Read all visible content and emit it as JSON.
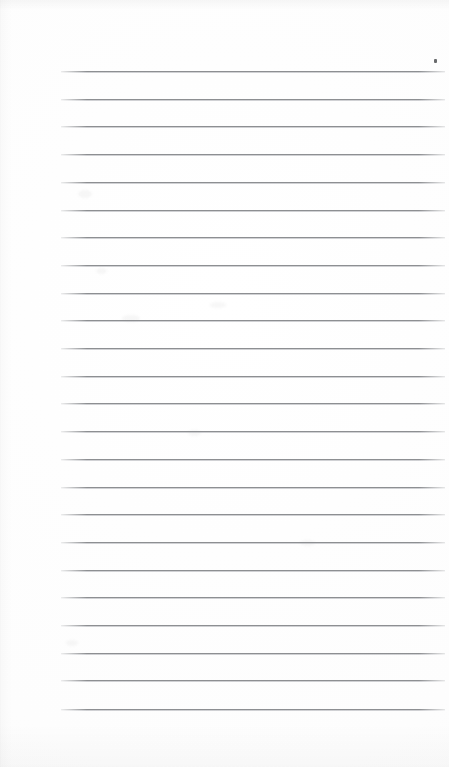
{
  "page": {
    "kind": "lined-notepad-page",
    "width_px": 449,
    "height_px": 767,
    "background_color": "#fdfdfd",
    "text_content": "",
    "written_text_present": "no",
    "orientation": "portrait"
  },
  "ruling": {
    "line_color": "#8d8f92",
    "line_thickness_px": 1,
    "line_count": 24,
    "line_left_px": 61,
    "line_right_px": 445,
    "line_width_px": 384,
    "first_line_y_px": 71,
    "last_line_y_px": 709,
    "line_spacing_px": 27.7,
    "margin_rule_present": "no",
    "header_rule_present": "no",
    "top_margin_px": 71,
    "bottom_margin_px": 58,
    "left_margin_px": 61,
    "right_margin_px": 4,
    "y_positions": [
      71,
      98.7,
      126.4,
      154.1,
      181.8,
      209.5,
      237.2,
      264.9,
      292.6,
      320.3,
      348,
      375.7,
      403.4,
      431.1,
      458.8,
      486.5,
      514.2,
      541.9,
      569.6,
      597.3,
      625,
      652.7,
      680.4,
      709
    ]
  },
  "marks": {
    "ink_speck": {
      "label": "stray-ink-speck",
      "x_px": 434,
      "y_px": 59,
      "width_px": 3,
      "height_px": 4,
      "color": "#5c5e61"
    },
    "smudges": [
      {
        "x_px": 78,
        "y_px": 190,
        "w_px": 14,
        "h_px": 8
      },
      {
        "x_px": 122,
        "y_px": 315,
        "w_px": 18,
        "h_px": 7
      },
      {
        "x_px": 96,
        "y_px": 268,
        "w_px": 11,
        "h_px": 6
      },
      {
        "x_px": 210,
        "y_px": 302,
        "w_px": 16,
        "h_px": 6
      },
      {
        "x_px": 188,
        "y_px": 430,
        "w_px": 13,
        "h_px": 6
      },
      {
        "x_px": 66,
        "y_px": 640,
        "w_px": 12,
        "h_px": 6
      },
      {
        "x_px": 300,
        "y_px": 540,
        "w_px": 15,
        "h_px": 6
      }
    ]
  }
}
